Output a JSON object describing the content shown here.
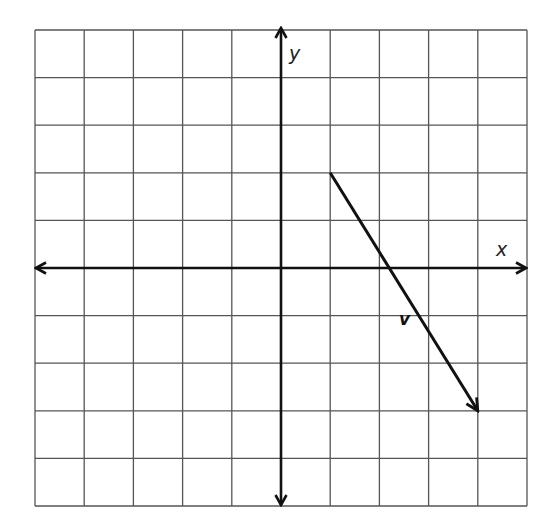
{
  "chart_data": {
    "type": "vector-plot",
    "title": "",
    "grid": true,
    "xlim": [
      -5,
      5
    ],
    "ylim": [
      -5,
      5
    ],
    "grid_step": 1,
    "xlabel": "x",
    "ylabel": "y",
    "axes_arrows": true,
    "vectors": [
      {
        "name": "v",
        "label": "v",
        "start": [
          1,
          2
        ],
        "end": [
          4,
          -3
        ],
        "components": [
          3,
          -5
        ],
        "label_position": [
          2.4,
          -1.2
        ]
      }
    ]
  },
  "labels": {
    "x_axis": "x",
    "y_axis": "y",
    "vector": "v"
  },
  "colors": {
    "background": "#ffffff",
    "grid": "#555555",
    "axes": "#111111",
    "vector": "#111111"
  },
  "layout": {
    "left": 35,
    "right": 527,
    "top": 30,
    "bottom": 506
  }
}
